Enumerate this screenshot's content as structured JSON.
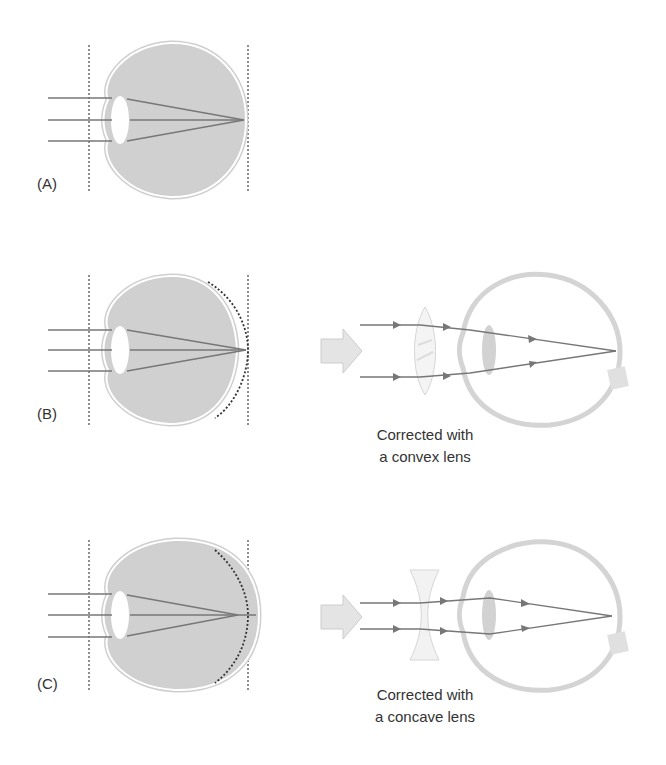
{
  "panels": [
    {
      "id": "A",
      "label": "(A)",
      "description": "normal eye - focus on retina"
    },
    {
      "id": "B",
      "label": "(B)",
      "description": "hyperopia - short eyeball",
      "caption_line1": "Corrected with",
      "caption_line2": "a convex lens"
    },
    {
      "id": "C",
      "label": "(C)",
      "description": "myopia - long eyeball",
      "caption_line1": "Corrected with",
      "caption_line2": "a concave lens"
    }
  ],
  "colors": {
    "eye_fill": "#d0d0d0",
    "eye_outline": "#c8c8c8",
    "ray": "#777777",
    "dotted": "#444444",
    "text": "#333333"
  }
}
